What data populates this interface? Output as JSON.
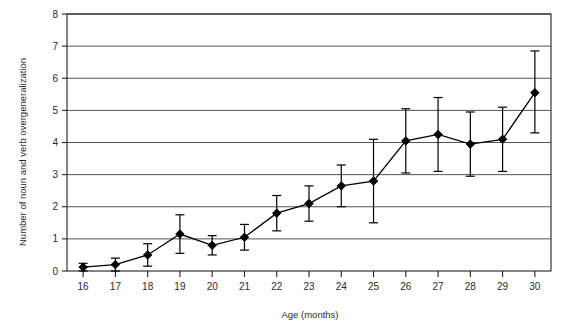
{
  "chart_data": {
    "type": "line",
    "title": "",
    "xlabel": "Age (months)",
    "ylabel": "Number of noun and verb overgeneralization",
    "xlim": [
      15.5,
      30.5
    ],
    "ylim": [
      0,
      8
    ],
    "grid": true,
    "legend": null,
    "errorbars": true,
    "xticks": [
      16,
      17,
      18,
      19,
      20,
      21,
      22,
      23,
      24,
      25,
      26,
      27,
      28,
      29,
      30
    ],
    "yticks": [
      0,
      1,
      2,
      3,
      4,
      5,
      6,
      7,
      8
    ],
    "x": [
      16,
      17,
      18,
      19,
      20,
      21,
      22,
      23,
      24,
      25,
      26,
      27,
      28,
      29,
      30
    ],
    "values": [
      0.12,
      0.2,
      0.5,
      1.15,
      0.8,
      1.05,
      1.8,
      2.1,
      2.65,
      2.8,
      4.05,
      4.25,
      3.95,
      4.1,
      5.55
    ],
    "err_low": [
      0.12,
      0.2,
      0.35,
      0.6,
      0.3,
      0.4,
      0.55,
      0.55,
      0.65,
      1.3,
      1.0,
      1.15,
      1.0,
      1.0,
      1.25
    ],
    "err_high": [
      0.12,
      0.2,
      0.35,
      0.6,
      0.3,
      0.4,
      0.55,
      0.55,
      0.65,
      1.3,
      1.0,
      1.15,
      1.0,
      1.0,
      1.3
    ],
    "series": [
      {
        "name": "Overgeneralizations",
        "marker": "diamond",
        "color": "#000000",
        "values": [
          0.12,
          0.2,
          0.5,
          1.15,
          0.8,
          1.05,
          1.8,
          2.1,
          2.65,
          2.8,
          4.05,
          4.25,
          3.95,
          4.1,
          5.55
        ]
      }
    ]
  },
  "axis": {
    "x_label": "Age (months)",
    "y_label": "Number of noun and verb overgeneralization",
    "x_tick_labels": [
      "16",
      "17",
      "18",
      "19",
      "20",
      "21",
      "22",
      "23",
      "24",
      "25",
      "26",
      "27",
      "28",
      "29",
      "30"
    ],
    "y_tick_labels": [
      "0",
      "1",
      "2",
      "3",
      "4",
      "5",
      "6",
      "7",
      "8"
    ]
  },
  "colors": {
    "line": "#000000",
    "marker": "#000000",
    "grid": "#555555",
    "frame": "#222222",
    "text": "#2b2b2b",
    "background": "#ffffff"
  }
}
